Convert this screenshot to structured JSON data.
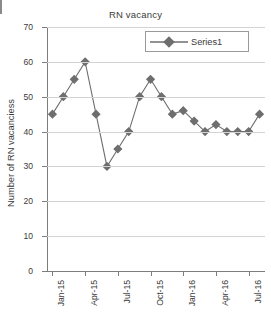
{
  "chart_data": {
    "type": "line",
    "title": "RN vacancy",
    "xlabel": "",
    "ylabel": "Number of RN vacanciess",
    "ylim": [
      0,
      70
    ],
    "ytick_values": [
      0,
      10,
      20,
      30,
      40,
      50,
      60,
      70
    ],
    "grid": "horizontal",
    "legend_position": "top-right",
    "marker": "diamond",
    "series_color": "#6e6e6e",
    "gridline_color": "#d3d3d3",
    "axis_color": "#7d7d7d",
    "categories": [
      "Jan-15",
      "Feb-15",
      "Mar-15",
      "Apr-15",
      "May-15",
      "Jun-15",
      "Jul-15",
      "Aug-15",
      "Sep-15",
      "Oct-15",
      "Nov-15",
      "Dec-15",
      "Jan-16",
      "Feb-16",
      "Mar-16",
      "Apr-16",
      "May-16",
      "Jun-16",
      "Jul-16",
      "Aug-16"
    ],
    "xtick_labels": [
      "Jan-15",
      "Apr-15",
      "Jul-15",
      "Oct-15",
      "Jan-16",
      "Apr-16",
      "Jul-16"
    ],
    "xtick_indices": [
      0,
      3,
      6,
      9,
      12,
      15,
      18
    ],
    "series": [
      {
        "name": "Series1",
        "values": [
          45,
          50,
          55,
          60,
          45,
          30,
          35,
          40,
          50,
          55,
          50,
          45,
          46,
          43,
          40,
          42,
          40,
          40,
          40,
          45
        ]
      }
    ]
  },
  "legend": {
    "label": "Series1"
  }
}
